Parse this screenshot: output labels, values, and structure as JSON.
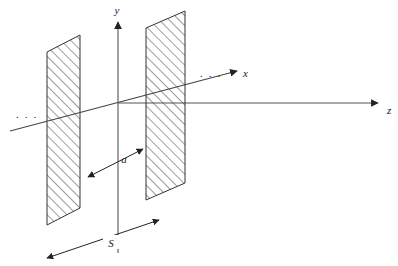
{
  "figure": {
    "kind": "parallel-plate-waveguide-cross-section",
    "background_color": "#ffffff",
    "line_color": "#333333",
    "hatch_color": "#4a4a4a",
    "text_color": "#1a1a1a"
  },
  "axes": [
    {
      "id": "y",
      "label": "y",
      "label_x": 117,
      "label_y": 14,
      "direction": "vertical-up"
    },
    {
      "id": "x",
      "label": "x",
      "label_x": 243,
      "label_y": 76,
      "direction": "oblique-up-right"
    },
    {
      "id": "z",
      "label": "z",
      "label_x": 388,
      "label_y": 113,
      "direction": "horizontal-right"
    }
  ],
  "plates": [
    {
      "id": "left-plate",
      "top_left_x": 47,
      "top_left_y": 52,
      "top_right_x": 80,
      "top_right_y": 35,
      "bottom_right_x": 80,
      "bottom_right_y": 208,
      "bottom_left_x": 47,
      "bottom_left_y": 225
    },
    {
      "id": "right-plate",
      "top_left_x": 146,
      "top_left_y": 28,
      "top_right_x": 185,
      "top_right_y": 11,
      "bottom_right_x": 185,
      "bottom_right_y": 183,
      "bottom_left_x": 146,
      "bottom_left_y": 200
    }
  ],
  "dimensions": [
    {
      "id": "plate-separation",
      "label": "a",
      "label_x": 124,
      "label_y": 162,
      "arrow_from_x": 88,
      "arrow_from_y": 175,
      "arrow_to_x": 143,
      "arrow_to_y": 148,
      "style": "double-headed"
    },
    {
      "id": "plate-width",
      "label": "S",
      "label_x": 110,
      "label_y": 245,
      "arrow_from_x": 46,
      "arrow_from_y": 259,
      "arrow_to_x": 160,
      "arrow_to_y": 220,
      "style": "double-headed"
    }
  ],
  "ellipses": [
    {
      "id": "left-ellipsis",
      "text": ". . .",
      "x": 16,
      "y": 117
    },
    {
      "id": "right-ellipsis",
      "text": ". . .",
      "x": 200,
      "y": 76
    }
  ],
  "origin": {
    "x": 118,
    "y": 103
  }
}
